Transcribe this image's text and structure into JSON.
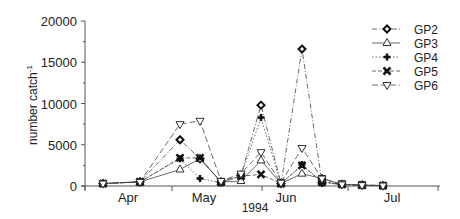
{
  "chart_data": {
    "type": "line",
    "title": "",
    "xlabel": "1994",
    "ylabel": "number catch-1",
    "ylim": [
      0,
      20000
    ],
    "yticks": [
      0,
      5000,
      10000,
      15000,
      20000
    ],
    "xtick_labels": [
      "Apr",
      "May",
      "Jun",
      "Jul"
    ],
    "grid": false,
    "legend_position": "upper right",
    "x": [
      1,
      2,
      3,
      4,
      5,
      6,
      7,
      8,
      9,
      10,
      11,
      12,
      13
    ],
    "series": [
      {
        "name": "GP2",
        "marker": "diamond",
        "line": "dash-dot",
        "values": [
          300,
          500,
          5600,
          3300,
          500,
          1300,
          9800,
          300,
          16600,
          400,
          200,
          100,
          50
        ]
      },
      {
        "name": "GP3",
        "marker": "triangle-up",
        "line": "solid",
        "values": [
          300,
          500,
          2000,
          3300,
          500,
          600,
          3100,
          300,
          1500,
          900,
          200,
          100,
          50
        ]
      },
      {
        "name": "GP4",
        "marker": "plus",
        "line": "dotted",
        "values": [
          300,
          500,
          3300,
          900,
          400,
          1200,
          8300,
          300,
          2600,
          500,
          200,
          100,
          50
        ]
      },
      {
        "name": "GP5",
        "marker": "x",
        "line": "dashed",
        "values": [
          300,
          500,
          3400,
          3400,
          500,
          1200,
          1400,
          300,
          2500,
          500,
          200,
          100,
          50
        ]
      },
      {
        "name": "GP6",
        "marker": "triangle-down",
        "line": "dash",
        "values": [
          300,
          500,
          7500,
          7900,
          600,
          1500,
          4100,
          400,
          4600,
          900,
          200,
          100,
          50
        ]
      }
    ]
  },
  "axis": {
    "y_title": "number catch",
    "y_title_sup": "-1",
    "x_title": "1994",
    "y_ticks": [
      "0",
      "5000",
      "10000",
      "15000",
      "20000"
    ],
    "x_months": [
      "Apr",
      "May",
      "Jun",
      "Jul"
    ]
  },
  "legend": [
    "GP2",
    "GP3",
    "GP4",
    "GP5",
    "GP6"
  ]
}
